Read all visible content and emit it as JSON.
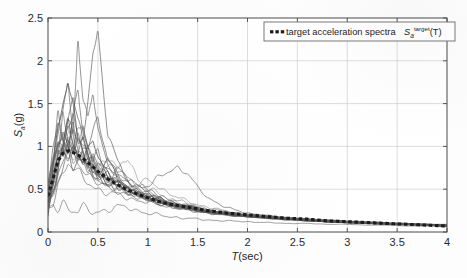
{
  "figure": {
    "background_color": "#fdfdfd",
    "axis_color": "#4a4a4a",
    "grid_color": "#cfcfcf",
    "curve_color": "#5a5a5a",
    "target_color": "#1c1c1c"
  },
  "axes": {
    "x_label_italic": "T",
    "x_label_rest": "(sec)",
    "y_label_main": "S",
    "y_label_sub": "a",
    "y_label_rest": "(g)",
    "x_ticks": [
      "0",
      "0.5",
      "1",
      "1.5",
      "2",
      "2.5",
      "3",
      "3.5",
      "4"
    ],
    "y_ticks": [
      "0",
      "0.5",
      "1",
      "1.5",
      "2",
      "2.5"
    ]
  },
  "legend": {
    "marker": "dashed-thick-square-marker",
    "text": "target acceleration spectra",
    "symbol_main": "S",
    "symbol_sub": "a",
    "symbol_sup": "target",
    "symbol_arg": "(T)"
  },
  "chart_data": {
    "type": "line",
    "title": "",
    "xlabel": "T(sec)",
    "ylabel": "Sa(g)",
    "xlim": [
      0,
      4
    ],
    "ylim": [
      0,
      2.5
    ],
    "xticks": [
      0,
      0.5,
      1,
      1.5,
      2,
      2.5,
      3,
      3.5,
      4
    ],
    "yticks": [
      0,
      0.5,
      1,
      1.5,
      2,
      2.5
    ],
    "grid": true,
    "legend_position": "top-right",
    "x": [
      0,
      0.05,
      0.1,
      0.15,
      0.2,
      0.25,
      0.3,
      0.35,
      0.4,
      0.45,
      0.5,
      0.6,
      0.7,
      0.8,
      0.9,
      1.0,
      1.1,
      1.2,
      1.3,
      1.4,
      1.5,
      1.6,
      1.8,
      2.0,
      2.2,
      2.4,
      2.6,
      2.8,
      3.0,
      3.2,
      3.4,
      3.6,
      3.8,
      4.0
    ],
    "series": [
      {
        "name": "target acceleration spectra Sa_target(T)",
        "style": "thick-dashed",
        "values": [
          0.42,
          0.62,
          0.83,
          0.92,
          0.95,
          0.93,
          0.9,
          0.86,
          0.81,
          0.76,
          0.71,
          0.62,
          0.55,
          0.49,
          0.44,
          0.4,
          0.36,
          0.33,
          0.31,
          0.29,
          0.27,
          0.25,
          0.22,
          0.2,
          0.18,
          0.16,
          0.15,
          0.13,
          0.12,
          0.11,
          0.1,
          0.09,
          0.08,
          0.07
        ]
      },
      {
        "name": "record-01",
        "style": "thin",
        "values": [
          0.33,
          0.7,
          1.25,
          1.52,
          1.78,
          1.4,
          1.02,
          1.15,
          0.95,
          0.72,
          0.7,
          0.83,
          0.6,
          0.52,
          0.47,
          0.4,
          0.34,
          0.31,
          0.28,
          0.26,
          0.24,
          0.22,
          0.2,
          0.18,
          0.16,
          0.14,
          0.13,
          0.12,
          0.11,
          0.1,
          0.09,
          0.08,
          0.08,
          0.07
        ]
      },
      {
        "name": "record-02",
        "style": "thin",
        "values": [
          0.3,
          0.55,
          0.9,
          1.45,
          1.7,
          1.2,
          2.25,
          1.55,
          1.3,
          1.62,
          1.22,
          0.78,
          0.66,
          0.58,
          0.5,
          0.42,
          0.38,
          0.34,
          0.3,
          0.27,
          0.25,
          0.23,
          0.2,
          0.18,
          0.16,
          0.15,
          0.13,
          0.12,
          0.11,
          0.1,
          0.09,
          0.09,
          0.08,
          0.07
        ]
      },
      {
        "name": "record-03",
        "style": "thin",
        "values": [
          0.35,
          0.62,
          0.95,
          1.1,
          1.35,
          1.6,
          1.25,
          1.05,
          1.55,
          2.1,
          2.33,
          1.15,
          0.8,
          0.62,
          0.56,
          0.48,
          0.42,
          0.37,
          0.33,
          0.3,
          0.27,
          0.25,
          0.22,
          0.19,
          0.17,
          0.15,
          0.14,
          0.12,
          0.11,
          0.1,
          0.1,
          0.09,
          0.08,
          0.07
        ]
      },
      {
        "name": "record-04",
        "style": "thin",
        "values": [
          0.28,
          0.48,
          0.72,
          0.96,
          1.18,
          1.0,
          0.88,
          1.12,
          1.05,
          0.86,
          0.74,
          0.9,
          0.7,
          0.88,
          0.62,
          0.5,
          0.45,
          0.4,
          0.35,
          0.32,
          0.29,
          0.26,
          0.23,
          0.2,
          0.18,
          0.16,
          0.14,
          0.13,
          0.12,
          0.11,
          0.1,
          0.09,
          0.08,
          0.07
        ]
      },
      {
        "name": "record-05",
        "style": "thin",
        "values": [
          0.4,
          0.8,
          1.05,
          0.88,
          1.25,
          1.45,
          1.15,
          0.92,
          0.85,
          0.95,
          0.78,
          0.66,
          0.72,
          0.6,
          0.52,
          0.55,
          0.62,
          0.7,
          0.76,
          0.68,
          0.52,
          0.4,
          0.28,
          0.22,
          0.19,
          0.17,
          0.15,
          0.14,
          0.12,
          0.11,
          0.1,
          0.09,
          0.09,
          0.08
        ]
      },
      {
        "name": "record-06",
        "style": "thin",
        "values": [
          0.25,
          0.3,
          0.28,
          0.34,
          0.3,
          0.26,
          0.24,
          0.28,
          0.26,
          0.22,
          0.24,
          0.26,
          0.3,
          0.28,
          0.25,
          0.22,
          0.2,
          0.18,
          0.17,
          0.16,
          0.15,
          0.14,
          0.13,
          0.12,
          0.11,
          0.1,
          0.1,
          0.09,
          0.09,
          0.08,
          0.08,
          0.07,
          0.07,
          0.06
        ]
      },
      {
        "name": "record-07",
        "style": "thin",
        "values": [
          0.38,
          0.75,
          1.42,
          1.1,
          0.95,
          1.3,
          1.62,
          1.2,
          1.0,
          1.18,
          1.35,
          0.82,
          0.68,
          0.58,
          0.5,
          0.44,
          0.38,
          0.34,
          0.31,
          0.28,
          0.26,
          0.24,
          0.21,
          0.19,
          0.17,
          0.15,
          0.14,
          0.12,
          0.11,
          0.1,
          0.1,
          0.09,
          0.08,
          0.07
        ]
      },
      {
        "name": "record-08",
        "style": "thin",
        "values": [
          0.45,
          0.9,
          1.15,
          0.92,
          1.05,
          0.85,
          0.78,
          0.95,
          0.88,
          0.72,
          0.65,
          0.58,
          0.62,
          0.54,
          0.48,
          0.42,
          0.36,
          0.32,
          0.29,
          0.27,
          0.25,
          0.23,
          0.2,
          0.18,
          0.16,
          0.15,
          0.13,
          0.12,
          0.11,
          0.1,
          0.09,
          0.09,
          0.08,
          0.07
        ]
      },
      {
        "name": "record-09",
        "style": "thin",
        "values": [
          0.32,
          0.58,
          0.82,
          1.05,
          1.3,
          1.08,
          0.92,
          0.8,
          0.95,
          1.08,
          0.88,
          0.7,
          0.58,
          0.5,
          0.45,
          0.4,
          0.36,
          0.33,
          0.3,
          0.28,
          0.26,
          0.24,
          0.21,
          0.19,
          0.17,
          0.15,
          0.14,
          0.13,
          0.12,
          0.11,
          0.1,
          0.09,
          0.08,
          0.07
        ]
      },
      {
        "name": "record-10",
        "style": "thin",
        "values": [
          0.36,
          0.66,
          0.98,
          1.22,
          1.05,
          0.9,
          1.1,
          1.28,
          1.02,
          0.84,
          0.95,
          0.72,
          0.6,
          0.52,
          0.46,
          0.41,
          0.37,
          0.33,
          0.3,
          0.28,
          0.25,
          0.23,
          0.2,
          0.18,
          0.17,
          0.15,
          0.14,
          0.12,
          0.11,
          0.11,
          0.1,
          0.09,
          0.08,
          0.08
        ]
      },
      {
        "name": "record-11",
        "style": "thin",
        "values": [
          0.29,
          0.52,
          0.78,
          0.95,
          0.88,
          1.02,
          0.92,
          0.78,
          0.72,
          0.8,
          0.68,
          0.58,
          0.52,
          0.46,
          0.42,
          0.38,
          0.35,
          0.32,
          0.29,
          0.27,
          0.25,
          0.23,
          0.2,
          0.18,
          0.16,
          0.15,
          0.13,
          0.12,
          0.11,
          0.1,
          0.09,
          0.09,
          0.08,
          0.07
        ]
      },
      {
        "name": "record-12",
        "style": "thin",
        "values": [
          0.5,
          0.95,
          1.3,
          1.08,
          0.92,
          1.18,
          0.98,
          0.82,
          0.9,
          0.75,
          0.66,
          0.6,
          0.54,
          0.48,
          0.44,
          0.4,
          0.36,
          0.33,
          0.3,
          0.28,
          0.26,
          0.24,
          0.21,
          0.19,
          0.17,
          0.16,
          0.14,
          0.13,
          0.12,
          0.11,
          0.1,
          0.09,
          0.08,
          0.07
        ]
      },
      {
        "name": "record-13",
        "style": "thin",
        "values": [
          0.27,
          0.46,
          0.68,
          0.85,
          1.0,
          0.92,
          0.82,
          0.74,
          0.68,
          0.62,
          0.58,
          0.52,
          0.48,
          0.44,
          0.4,
          0.37,
          0.34,
          0.31,
          0.29,
          0.27,
          0.25,
          0.23,
          0.2,
          0.18,
          0.16,
          0.15,
          0.13,
          0.12,
          0.11,
          0.1,
          0.1,
          0.09,
          0.08,
          0.07
        ]
      },
      {
        "name": "record-14",
        "style": "thin",
        "values": [
          0.42,
          0.85,
          1.18,
          1.38,
          1.12,
          0.95,
          1.05,
          0.88,
          0.76,
          0.7,
          0.8,
          0.64,
          0.56,
          0.5,
          0.45,
          0.41,
          0.37,
          0.34,
          0.31,
          0.29,
          0.26,
          0.24,
          0.21,
          0.19,
          0.17,
          0.15,
          0.14,
          0.12,
          0.11,
          0.11,
          0.1,
          0.09,
          0.08,
          0.08
        ]
      },
      {
        "name": "record-15",
        "style": "thin",
        "values": [
          0.34,
          0.6,
          0.88,
          1.02,
          0.92,
          0.8,
          0.88,
          0.96,
          0.82,
          0.7,
          0.62,
          0.7,
          0.58,
          0.5,
          0.46,
          0.42,
          0.38,
          0.35,
          0.32,
          0.3,
          0.27,
          0.25,
          0.22,
          0.2,
          0.18,
          0.16,
          0.14,
          0.13,
          0.12,
          0.11,
          0.1,
          0.09,
          0.08,
          0.07
        ]
      },
      {
        "name": "record-16",
        "style": "thin",
        "values": [
          0.48,
          0.72,
          1.08,
          0.9,
          1.15,
          1.02,
          0.86,
          0.92,
          0.78,
          0.68,
          0.72,
          0.62,
          0.55,
          0.5,
          0.56,
          0.6,
          0.54,
          0.46,
          0.4,
          0.36,
          0.32,
          0.29,
          0.24,
          0.21,
          0.19,
          0.17,
          0.15,
          0.14,
          0.12,
          0.12,
          0.11,
          0.1,
          0.09,
          0.08
        ]
      },
      {
        "name": "record-17",
        "style": "thin",
        "values": [
          0.31,
          0.56,
          0.82,
          0.98,
          1.12,
          0.96,
          0.84,
          0.76,
          0.88,
          0.78,
          0.66,
          0.58,
          0.52,
          0.47,
          0.43,
          0.39,
          0.36,
          0.33,
          0.3,
          0.28,
          0.26,
          0.24,
          0.21,
          0.19,
          0.17,
          0.15,
          0.14,
          0.13,
          0.12,
          0.11,
          0.1,
          0.09,
          0.08,
          0.07
        ]
      },
      {
        "name": "record-18",
        "style": "thin",
        "values": [
          0.26,
          0.42,
          0.6,
          0.76,
          0.9,
          1.05,
          0.92,
          0.8,
          0.72,
          0.66,
          0.6,
          0.54,
          0.5,
          0.46,
          0.42,
          0.38,
          0.35,
          0.32,
          0.3,
          0.28,
          0.26,
          0.24,
          0.21,
          0.19,
          0.17,
          0.16,
          0.14,
          0.13,
          0.12,
          0.11,
          0.1,
          0.09,
          0.09,
          0.08
        ]
      },
      {
        "name": "record-19",
        "style": "thin",
        "values": [
          0.44,
          0.78,
          1.0,
          1.2,
          0.98,
          0.86,
          0.95,
          0.82,
          0.74,
          0.88,
          0.7,
          0.6,
          0.54,
          0.49,
          0.45,
          0.41,
          0.38,
          0.35,
          0.32,
          0.3,
          0.27,
          0.25,
          0.22,
          0.2,
          0.18,
          0.16,
          0.15,
          0.13,
          0.12,
          0.11,
          0.1,
          0.1,
          0.09,
          0.08
        ]
      },
      {
        "name": "record-20",
        "style": "thin",
        "values": [
          0.37,
          0.68,
          0.92,
          1.05,
          1.22,
          1.08,
          0.9,
          0.86,
          0.98,
          0.8,
          0.68,
          0.72,
          0.76,
          0.64,
          0.54,
          0.48,
          0.43,
          0.39,
          0.36,
          0.33,
          0.3,
          0.27,
          0.23,
          0.2,
          0.18,
          0.16,
          0.15,
          0.13,
          0.12,
          0.11,
          0.1,
          0.09,
          0.08,
          0.07
        ]
      },
      {
        "name": "record-21",
        "style": "thin",
        "values": [
          0.39,
          0.64,
          0.86,
          1.0,
          0.88,
          0.94,
          1.08,
          0.9,
          0.8,
          0.72,
          0.64,
          0.56,
          0.52,
          0.48,
          0.44,
          0.4,
          0.37,
          0.34,
          0.31,
          0.29,
          0.26,
          0.24,
          0.21,
          0.19,
          0.17,
          0.16,
          0.14,
          0.13,
          0.12,
          0.11,
          0.1,
          0.09,
          0.08,
          0.08
        ]
      },
      {
        "name": "record-22",
        "style": "thin",
        "values": [
          0.3,
          0.5,
          0.74,
          0.92,
          1.08,
          1.22,
          1.04,
          0.88,
          0.78,
          0.9,
          0.74,
          0.62,
          0.56,
          0.5,
          0.46,
          0.42,
          0.39,
          0.36,
          0.33,
          0.31,
          0.28,
          0.26,
          0.22,
          0.2,
          0.18,
          0.16,
          0.15,
          0.13,
          0.12,
          0.11,
          0.1,
          0.09,
          0.09,
          0.08
        ]
      },
      {
        "name": "record-23",
        "style": "thin",
        "values": [
          0.52,
          0.88,
          1.1,
          0.95,
          1.28,
          1.05,
          0.92,
          1.02,
          0.86,
          0.74,
          0.82,
          0.68,
          0.58,
          0.52,
          0.47,
          0.43,
          0.39,
          0.35,
          0.32,
          0.3,
          0.27,
          0.25,
          0.22,
          0.19,
          0.17,
          0.16,
          0.14,
          0.13,
          0.12,
          0.11,
          0.1,
          0.09,
          0.08,
          0.07
        ]
      },
      {
        "name": "record-24",
        "style": "thin",
        "values": [
          0.24,
          0.38,
          0.55,
          0.7,
          0.82,
          0.76,
          0.68,
          0.62,
          0.58,
          0.54,
          0.5,
          0.46,
          0.43,
          0.4,
          0.37,
          0.35,
          0.32,
          0.3,
          0.28,
          0.26,
          0.25,
          0.23,
          0.21,
          0.19,
          0.17,
          0.16,
          0.15,
          0.14,
          0.13,
          0.12,
          0.11,
          0.1,
          0.09,
          0.09
        ]
      }
    ]
  }
}
